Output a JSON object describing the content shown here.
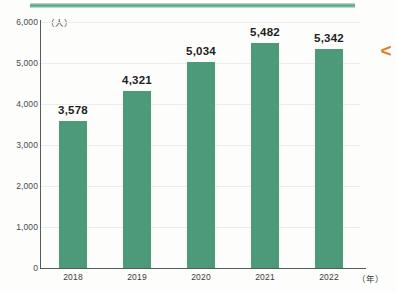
{
  "chart_data": {
    "type": "bar",
    "title": "",
    "categories": [
      "2018",
      "2019",
      "2020",
      "2021",
      "2022"
    ],
    "values": [
      3578,
      5482,
      5034,
      5482,
      5342
    ],
    "series": [
      {
        "name": "人数",
        "values": [
          3578,
          4321,
          5034,
          5482,
          5342
        ]
      }
    ],
    "value_labels": [
      "3,578",
      "4,321",
      "5,034",
      "5,482",
      "5,342"
    ],
    "xlabel": "（年）",
    "ylabel": "（人）",
    "ylim": [
      0,
      6000
    ],
    "ytick_values": [
      0,
      1000,
      2000,
      3000,
      4000,
      5000,
      6000
    ],
    "ytick_labels": [
      "0",
      "1,000",
      "2,000",
      "3,000",
      "4,000",
      "5,000",
      "6,000"
    ],
    "grid": true,
    "grid_axis": "y",
    "legend": null,
    "bar_color": "#4c9a7a",
    "axis_color": "#58595b",
    "gridline_color": "#ededf0",
    "label_color": "#1d1d1d"
  },
  "decorations": {
    "top_band_color": "#56a287",
    "marker_glyph": "<",
    "marker_color": "#e87a24"
  }
}
